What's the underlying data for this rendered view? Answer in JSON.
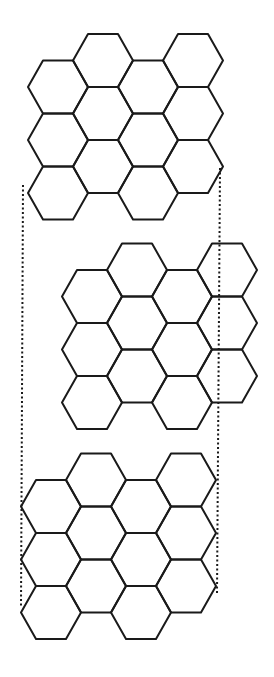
{
  "figure": {
    "type": "hexagonal-lattice-stack",
    "line_color": "#1a1a1a",
    "background_color": "#ffffff",
    "layers": [
      {
        "name": "top-layer",
        "columns": 4,
        "hexes_per_column": 3,
        "orientation": "flat-top"
      },
      {
        "name": "middle-layer",
        "columns": 4,
        "hexes_per_column": 3,
        "orientation": "flat-top"
      },
      {
        "name": "bottom-layer",
        "columns": 4,
        "hexes_per_column": 3,
        "orientation": "flat-top"
      }
    ],
    "guides": [
      {
        "name": "left-alignment-line",
        "style": "dotted"
      },
      {
        "name": "right-alignment-line",
        "style": "dotted"
      }
    ]
  }
}
